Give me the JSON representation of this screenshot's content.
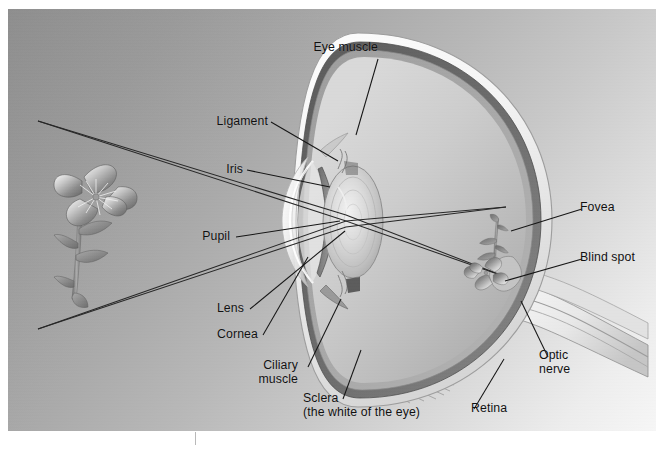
{
  "figure": {
    "type": "anatomical-diagram",
    "background": {
      "panel_gradient_from": "#8e8e8e",
      "panel_gradient_to": "#f6f6f6",
      "page_color": "#ffffff"
    },
    "line_color": "#1a1a1a",
    "text_color": "#101010"
  },
  "labels": {
    "eye_muscle": "Eye muscle",
    "ligament": "Ligament",
    "iris": "Iris",
    "pupil": "Pupil",
    "lens": "Lens",
    "cornea": "Cornea",
    "ciliary_muscle_line1": "Ciliary",
    "ciliary_muscle_line2": "muscle",
    "sclera_line1": "Sclera",
    "sclera_line2": "(the white of the eye)",
    "retina": "Retina",
    "fovea": "Fovea",
    "blind_spot": "Blind spot",
    "optic_nerve_line1": "Optic",
    "optic_nerve_line2": "nerve"
  },
  "objects": {
    "object_flower": "flower-object-upright",
    "image_flower": "flower-retinal-image-inverted",
    "light_rays": "light-ray-paths"
  }
}
